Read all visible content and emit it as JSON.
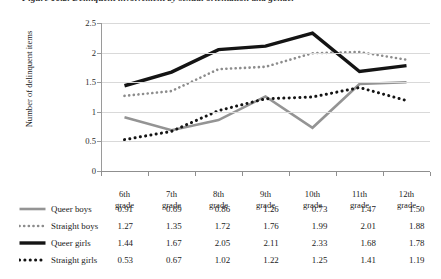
{
  "figure": {
    "caption": "Figure 10.2. Delinquent involvement by sexual orientation and gender"
  },
  "chart_data": {
    "type": "line",
    "title": "",
    "xlabel": "",
    "ylabel": "Number of delinquent items",
    "categories": [
      "6th grade",
      "7th grade",
      "8th grade",
      "9th grade",
      "10th grade",
      "11th grade",
      "12th grade"
    ],
    "category_lines": [
      [
        "6th",
        "grade"
      ],
      [
        "7th",
        "grade"
      ],
      [
        "8th",
        "grade"
      ],
      [
        "9th",
        "grade"
      ],
      [
        "10th",
        "grade"
      ],
      [
        "11th",
        "grade"
      ],
      [
        "12th",
        "grade"
      ]
    ],
    "ylim": [
      0,
      2.5
    ],
    "yticks": [
      0,
      0.5,
      1,
      1.5,
      2,
      2.5
    ],
    "ytick_labels": [
      "0",
      "0.5",
      "1",
      "1.5",
      "2",
      "2.5"
    ],
    "grid": "horizontal",
    "legend_position": "table-below",
    "series": [
      {
        "name": "Queer boys",
        "style": "solid",
        "color": "#949494",
        "width": 2.6,
        "values": [
          0.91,
          0.69,
          0.86,
          1.26,
          0.73,
          1.47,
          1.5
        ],
        "display_values": [
          "0.91",
          "0.69",
          "0.86",
          "1.26",
          "0.73",
          "1.47",
          "1.50"
        ]
      },
      {
        "name": "Straight boys",
        "style": "dotted",
        "color": "#8c8c8c",
        "width": 2.6,
        "values": [
          1.27,
          1.35,
          1.72,
          1.76,
          1.99,
          2.01,
          1.88
        ],
        "display_values": [
          "1.27",
          "1.35",
          "1.72",
          "1.76",
          "1.99",
          "2.01",
          "1.88"
        ]
      },
      {
        "name": "Queer girls",
        "style": "solid",
        "color": "#141414",
        "width": 3.4,
        "values": [
          1.44,
          1.67,
          2.05,
          2.11,
          2.33,
          1.68,
          1.78
        ],
        "display_values": [
          "1.44",
          "1.67",
          "2.05",
          "2.11",
          "2.33",
          "1.68",
          "1.78"
        ]
      },
      {
        "name": "Straight girls",
        "style": "dotted",
        "color": "#141414",
        "width": 3.0,
        "values": [
          0.53,
          0.67,
          1.02,
          1.22,
          1.25,
          1.41,
          1.19
        ],
        "display_values": [
          "0.53",
          "0.67",
          "1.02",
          "1.22",
          "1.25",
          "1.41",
          "1.19"
        ]
      }
    ]
  }
}
